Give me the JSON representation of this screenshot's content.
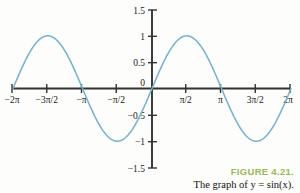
{
  "figure": {
    "number_label": "FIGURE 4.21.",
    "caption": "The graph of y = sin(x).",
    "number_color": "#9aba54",
    "caption_color": "#111111"
  },
  "chart_data": {
    "type": "line",
    "title": "",
    "subtitle": "",
    "xlabel": "",
    "ylabel": "",
    "function": "y = sin(x)",
    "xlim": [
      -6.283185307,
      6.283185307
    ],
    "ylim": [
      -1.5,
      1.5
    ],
    "grid": false,
    "legend": null,
    "curve_color": "#6fb4cf",
    "axis_color": "#333333",
    "x_ticks": [
      {
        "value": -6.283185307,
        "label": "−2π"
      },
      {
        "value": -4.71238898,
        "label": "−3π/2"
      },
      {
        "value": -3.141592654,
        "label": "−π"
      },
      {
        "value": -1.570796327,
        "label": "−π/2"
      },
      {
        "value": 1.570796327,
        "label": "π/2"
      },
      {
        "value": 3.141592654,
        "label": "π"
      },
      {
        "value": 4.71238898,
        "label": "3π/2"
      },
      {
        "value": 6.283185307,
        "label": "2π"
      }
    ],
    "y_ticks": [
      {
        "value": 1.5,
        "label": "1.5"
      },
      {
        "value": 1.0,
        "label": "1"
      },
      {
        "value": 0.5,
        "label": "0.5"
      },
      {
        "value": 0.0,
        "label": "0"
      },
      {
        "value": -0.5,
        "label": "−0.5"
      },
      {
        "value": -1.0,
        "label": "−1"
      },
      {
        "value": -1.5,
        "label": "−1.5"
      }
    ],
    "series": [
      {
        "name": "sin(x)",
        "x": [
          -6.2832,
          -5.8905,
          -5.4978,
          -5.1051,
          -4.7124,
          -4.3197,
          -3.927,
          -3.5343,
          -3.1416,
          -2.7489,
          -2.3562,
          -1.9635,
          -1.5708,
          -1.1781,
          -0.7854,
          -0.3927,
          0.0,
          0.3927,
          0.7854,
          1.1781,
          1.5708,
          1.9635,
          2.3562,
          2.7489,
          3.1416,
          3.5343,
          3.927,
          4.3197,
          4.7124,
          5.1051,
          5.4978,
          5.8905,
          6.2832
        ],
        "values": [
          0.0,
          0.3827,
          0.7071,
          0.9239,
          1.0,
          0.9239,
          0.7071,
          0.3827,
          0.0,
          -0.3827,
          -0.7071,
          -0.9239,
          -1.0,
          -0.9239,
          -0.7071,
          -0.3827,
          0.0,
          0.3827,
          0.7071,
          0.9239,
          1.0,
          0.9239,
          0.7071,
          0.3827,
          0.0,
          -0.3827,
          -0.7071,
          -0.9239,
          -1.0,
          -0.9239,
          -0.7071,
          -0.3827,
          0.0
        ]
      }
    ]
  }
}
